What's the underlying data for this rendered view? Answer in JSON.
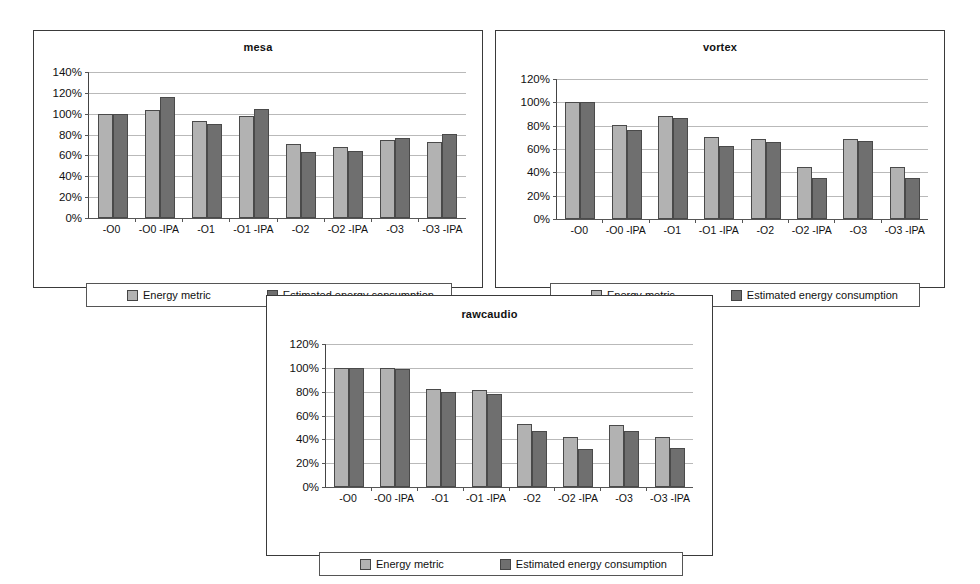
{
  "legend": {
    "metric_label": "Energy metric",
    "energy_label": "Estimated energy consumption"
  },
  "colors": {
    "metric_bar": "#b2b2b2",
    "energy_bar": "#6f6f6f",
    "gridline": "#b9b9b9",
    "axis": "#444444",
    "background": "#ffffff"
  },
  "chart_data": [
    {
      "type": "bar",
      "title": "mesa",
      "xlabel": "",
      "ylabel": "",
      "ylim": [
        0,
        140
      ],
      "yticks": [
        0,
        20,
        40,
        60,
        80,
        100,
        120,
        140
      ],
      "ytick_labels": [
        "0%",
        "20%",
        "40%",
        "60%",
        "80%",
        "100%",
        "120%",
        "140%"
      ],
      "grid": true,
      "legend_position": "bottom",
      "categories": [
        "-O0",
        "-O0 -IPA",
        "-O1",
        "-O1 -IPA",
        "-O2",
        "-O2 -IPA",
        "-O3",
        "-O3 -IPA"
      ],
      "series": [
        {
          "name": "Energy metric",
          "values": [
            100,
            104,
            93,
            98,
            71,
            68,
            75,
            73
          ]
        },
        {
          "name": "Estimated energy consumption",
          "values": [
            100,
            116,
            90,
            105,
            63,
            64,
            77,
            81
          ]
        }
      ]
    },
    {
      "type": "bar",
      "title": "vortex",
      "xlabel": "",
      "ylabel": "",
      "ylim": [
        0,
        120
      ],
      "yticks": [
        0,
        20,
        40,
        60,
        80,
        100,
        120
      ],
      "ytick_labels": [
        "0%",
        "20%",
        "40%",
        "60%",
        "80%",
        "100%",
        "120%"
      ],
      "grid": true,
      "legend_position": "bottom",
      "categories": [
        "-O0",
        "-O0 -IPA",
        "-O1",
        "-O1 -IPA",
        "-O2",
        "-O2 -IPA",
        "-O3",
        "-O3 -IPA"
      ],
      "series": [
        {
          "name": "Energy metric",
          "values": [
            100,
            81,
            88,
            70,
            69,
            45,
            69,
            45
          ]
        },
        {
          "name": "Estimated energy consumption",
          "values": [
            100,
            76,
            87,
            63,
            66,
            35,
            67,
            35
          ]
        }
      ]
    },
    {
      "type": "bar",
      "title": "rawcaudio",
      "xlabel": "",
      "ylabel": "",
      "ylim": [
        0,
        120
      ],
      "yticks": [
        0,
        20,
        40,
        60,
        80,
        100,
        120
      ],
      "ytick_labels": [
        "0%",
        "20%",
        "40%",
        "60%",
        "80%",
        "100%",
        "120%"
      ],
      "grid": true,
      "legend_position": "bottom",
      "categories": [
        "-O0",
        "-O0 -IPA",
        "-O1",
        "-O1 -IPA",
        "-O2",
        "-O2 -IPA",
        "-O3",
        "-O3 -IPA"
      ],
      "series": [
        {
          "name": "Energy metric",
          "values": [
            100,
            100,
            82,
            81,
            53,
            42,
            52,
            42
          ]
        },
        {
          "name": "Estimated energy consumption",
          "values": [
            100,
            99,
            80,
            78,
            47,
            32,
            47,
            33
          ]
        }
      ]
    }
  ]
}
